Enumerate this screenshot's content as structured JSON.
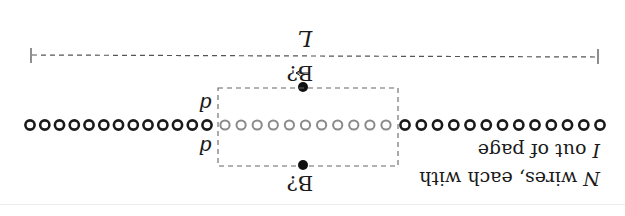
{
  "figure": {
    "orientation": "rotated-180",
    "length_label": "L",
    "field_label_top": "B?",
    "field_label_top_has_vector_arrow": true,
    "field_label_bottom": "B?",
    "distance_label_top": "d",
    "distance_label_bottom": "d",
    "caption_line1": "N wires, each with",
    "caption_line2": "I out of page",
    "caption_line1_italic_prefix": "N",
    "caption_line2_italic_prefix": "I",
    "wires": {
      "left_count": 13,
      "middle_count": 11,
      "right_count": 13,
      "left_color": "#1a1a1a",
      "middle_color": "#8a8a8a",
      "right_color": "#1a1a1a"
    },
    "colors": {
      "ink": "#1a1a1a",
      "dash": "#555555",
      "highlight_wires": "#8a8a8a",
      "background": "#ffffff"
    }
  }
}
